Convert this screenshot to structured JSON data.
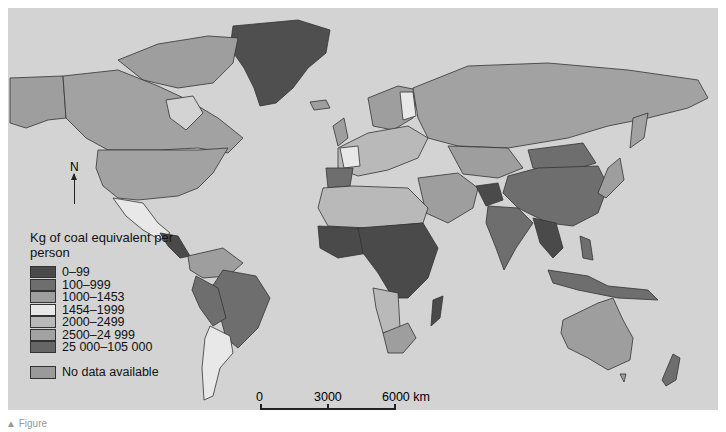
{
  "legend": {
    "title": "Kg of coal equivalent per person",
    "items": [
      {
        "label": "0–99",
        "color": "#4a4a4a"
      },
      {
        "label": "100–999",
        "color": "#6e6e6e"
      },
      {
        "label": "1000–1453",
        "color": "#9e9e9e"
      },
      {
        "label": "1454–1999",
        "color": "#e8e8e8"
      },
      {
        "label": "2000–2499",
        "color": "#b9b9b9"
      },
      {
        "label": "2500–24 999",
        "color": "#a2a2a2"
      },
      {
        "label": "25 000–105 000",
        "color": "#666666"
      }
    ],
    "no_data": {
      "label": "No data available",
      "color": "#9a9a9a"
    }
  },
  "north_arrow": {
    "label": "N"
  },
  "scale_bar": {
    "labels": [
      "0",
      "3000",
      "6000 km"
    ]
  },
  "caption": {
    "text": "▲ Figure"
  },
  "colors": {
    "ocean": "#d3d3d3",
    "border": "#222222"
  }
}
